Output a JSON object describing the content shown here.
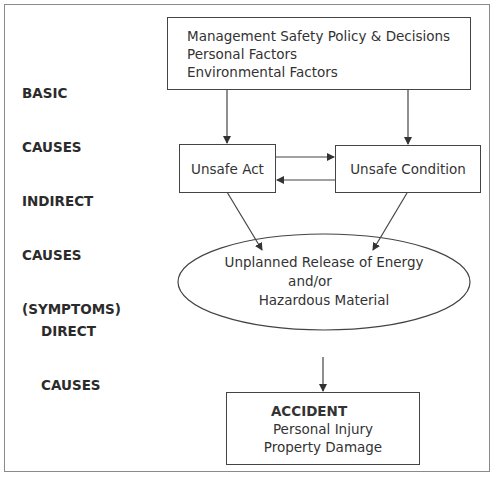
{
  "left_labels": {
    "basic": [
      "BASIC",
      "CAUSES"
    ],
    "indirect": [
      "INDIRECT",
      "CAUSES",
      "(SYMPTOMS)"
    ],
    "direct": [
      "DIRECT",
      "CAUSES"
    ]
  },
  "basic_box": {
    "lines": [
      "Management Safety Policy & Decisions",
      "Personal Factors",
      "Environmental Factors"
    ]
  },
  "unsafe_act": {
    "label": "Unsafe Act"
  },
  "unsafe_condition": {
    "label": "Unsafe Condition"
  },
  "direct_ellipse": {
    "lines": [
      "Unplanned Release of Energy",
      "and/or",
      "Hazardous Material"
    ]
  },
  "accident_box": {
    "title": "ACCIDENT",
    "lines": [
      "Personal Injury",
      "Property Damage"
    ]
  },
  "colors": {
    "line": "#444444",
    "frame": "#8a8a8a",
    "text": "#333333"
  }
}
